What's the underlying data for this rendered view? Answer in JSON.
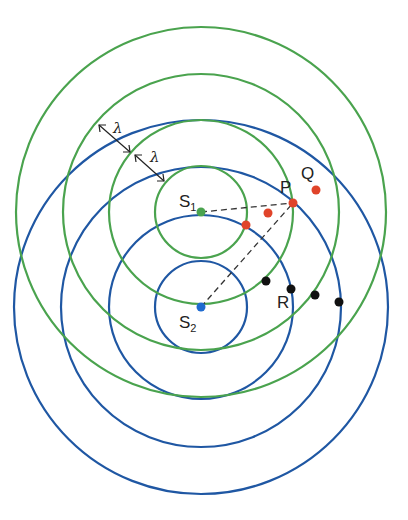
{
  "diagram": {
    "colors": {
      "source1_wavefronts": "#4aa34e",
      "source2_wavefronts": "#1f57a3",
      "constructive_points": "#e0442a",
      "destructive_points": "#111111",
      "source1_dot": "#4aa34e",
      "source2_dot": "#1f6bd0",
      "dashed_lines": "#333333"
    },
    "sources": [
      {
        "id": "S1",
        "label": "S",
        "subscript": "1",
        "cx": 201,
        "cy": 212,
        "radii": [
          46,
          92,
          138,
          185
        ]
      },
      {
        "id": "S2",
        "label": "S",
        "subscript": "2",
        "cx": 201,
        "cy": 307,
        "radii": [
          46,
          92,
          140,
          187
        ]
      }
    ],
    "wavelength_label": "λ",
    "points": {
      "red": [
        {
          "x": 246,
          "y": 225
        },
        {
          "x": 268,
          "y": 213
        },
        {
          "x": 293,
          "y": 203
        },
        {
          "x": 316,
          "y": 190
        }
      ],
      "black": [
        {
          "x": 266,
          "y": 281
        },
        {
          "x": 291,
          "y": 289
        },
        {
          "x": 315,
          "y": 295
        },
        {
          "x": 339,
          "y": 302
        }
      ]
    },
    "labels": {
      "P": "P",
      "Q": "Q",
      "R": "R"
    }
  }
}
